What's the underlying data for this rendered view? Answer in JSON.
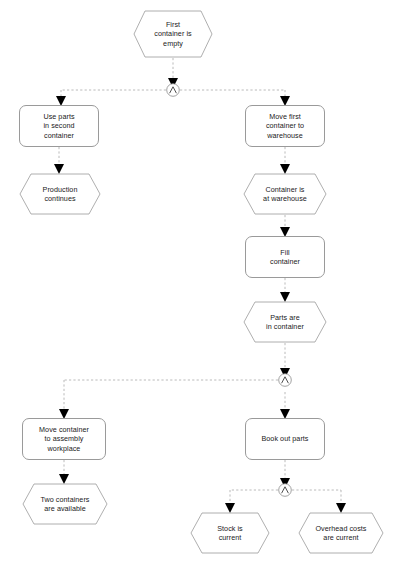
{
  "diagram": {
    "type": "epc-flowchart",
    "colors": {
      "background": "#ffffff",
      "shape_stroke": "#9a9a9a",
      "connector_stroke": "#8a8a8a",
      "edge_stroke": "#a8a8a8",
      "arrow_fill": "#000000",
      "text": "#1a1a1a"
    },
    "nodes": [
      {
        "id": "e1",
        "shape": "hexagon",
        "label": "First\ncontainer is\nempty",
        "x": 133,
        "y": 10,
        "w": 80,
        "h": 48
      },
      {
        "id": "f1",
        "shape": "box",
        "label": "Use parts\nin second\ncontainer",
        "x": 19,
        "y": 105,
        "w": 80,
        "h": 42
      },
      {
        "id": "e2",
        "shape": "hexagon",
        "label": "Production\ncontinues",
        "x": 19,
        "y": 173,
        "w": 82,
        "h": 42
      },
      {
        "id": "f2",
        "shape": "box",
        "label": "Move first\ncontainer to\nwarehouse",
        "x": 245,
        "y": 105,
        "w": 80,
        "h": 42
      },
      {
        "id": "e3",
        "shape": "hexagon",
        "label": "Container is\nat warehouse",
        "x": 243,
        "y": 173,
        "w": 84,
        "h": 42
      },
      {
        "id": "f3",
        "shape": "box",
        "label": "Fill\ncontainer",
        "x": 245,
        "y": 236,
        "w": 80,
        "h": 42
      },
      {
        "id": "e4",
        "shape": "hexagon",
        "label": "Parts are\nin container",
        "x": 243,
        "y": 301,
        "w": 84,
        "h": 42
      },
      {
        "id": "f4",
        "shape": "box",
        "label": "Move container\nto assembly\nworkplace",
        "x": 22,
        "y": 418,
        "w": 84,
        "h": 42
      },
      {
        "id": "e5",
        "shape": "hexagon",
        "label": "Two containers\nare available",
        "x": 22,
        "y": 483,
        "w": 86,
        "h": 42
      },
      {
        "id": "f5",
        "shape": "box",
        "label": "Book out parts",
        "x": 245,
        "y": 418,
        "w": 80,
        "h": 42
      },
      {
        "id": "e6",
        "shape": "hexagon",
        "label": "Stock is\ncurrent",
        "x": 190,
        "y": 512,
        "w": 80,
        "h": 42
      },
      {
        "id": "e7",
        "shape": "hexagon",
        "label": "Overhead costs\nare current",
        "x": 298,
        "y": 512,
        "w": 86,
        "h": 42
      }
    ],
    "connectors": [
      {
        "id": "and1",
        "symbol": "∧",
        "name": "and-connector",
        "cx": 173,
        "cy": 90
      },
      {
        "id": "and2",
        "symbol": "∧",
        "name": "and-connector",
        "cx": 285,
        "cy": 380
      },
      {
        "id": "and3",
        "symbol": "∧",
        "name": "and-connector",
        "cx": 285,
        "cy": 490
      }
    ]
  }
}
